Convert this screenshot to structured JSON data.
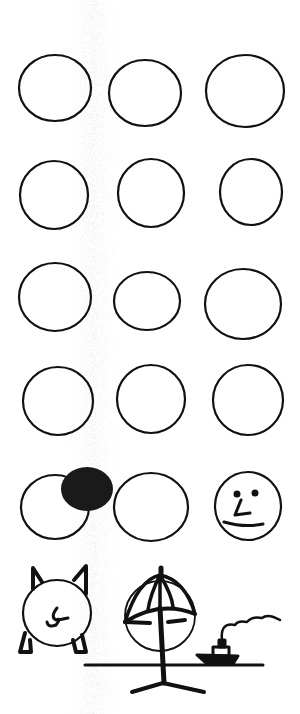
{
  "canvas": {
    "width": 300,
    "height": 714,
    "background": "#ffffff",
    "ink": "#111111"
  },
  "smudge": {
    "color": "#9a9a9a",
    "x_center": 95
  },
  "circles": [
    {
      "row": 1,
      "col": 1,
      "cx": 55,
      "cy": 88,
      "rx": 36,
      "ry": 33,
      "filled": false
    },
    {
      "row": 1,
      "col": 2,
      "cx": 145,
      "cy": 93,
      "rx": 36,
      "ry": 33,
      "filled": false
    },
    {
      "row": 1,
      "col": 3,
      "cx": 245,
      "cy": 91,
      "rx": 39,
      "ry": 36,
      "filled": false
    },
    {
      "row": 2,
      "col": 1,
      "cx": 54,
      "cy": 195,
      "rx": 34,
      "ry": 34,
      "filled": false
    },
    {
      "row": 2,
      "col": 2,
      "cx": 151,
      "cy": 193,
      "rx": 33,
      "ry": 34,
      "filled": false
    },
    {
      "row": 2,
      "col": 3,
      "cx": 251,
      "cy": 192,
      "rx": 31,
      "ry": 33,
      "filled": false
    },
    {
      "row": 3,
      "col": 1,
      "cx": 55,
      "cy": 297,
      "rx": 36,
      "ry": 34,
      "filled": false
    },
    {
      "row": 3,
      "col": 2,
      "cx": 147,
      "cy": 301,
      "rx": 33,
      "ry": 29,
      "filled": false
    },
    {
      "row": 3,
      "col": 3,
      "cx": 243,
      "cy": 304,
      "rx": 38,
      "ry": 35,
      "filled": false
    },
    {
      "row": 4,
      "col": 1,
      "cx": 58,
      "cy": 401,
      "rx": 35,
      "ry": 34,
      "filled": false
    },
    {
      "row": 4,
      "col": 2,
      "cx": 151,
      "cy": 399,
      "rx": 34,
      "ry": 34,
      "filled": false
    },
    {
      "row": 4,
      "col": 3,
      "cx": 248,
      "cy": 400,
      "rx": 35,
      "ry": 35,
      "filled": false
    },
    {
      "row": 5,
      "col": 1,
      "cx": 55,
      "cy": 507,
      "rx": 34,
      "ry": 32,
      "filled": false
    },
    {
      "row": 5,
      "col": 2,
      "cx": 151,
      "cy": 507,
      "rx": 37,
      "ry": 34,
      "filled": false
    },
    {
      "row": 5,
      "col": 3,
      "cx": 248,
      "cy": 506,
      "rx": 33,
      "ry": 34,
      "filled": false
    }
  ],
  "overlays": {
    "dark_blob": {
      "cx": 87,
      "cy": 489,
      "rx": 26,
      "ry": 22,
      "color": "#1a1a1a"
    },
    "face": {
      "label": "face-doodle"
    }
  },
  "bottom_scene": {
    "pig_label": "pig-doodle",
    "umbrella_label": "beach-umbrella",
    "boat_label": "steamboat",
    "horizon_y": 665
  }
}
